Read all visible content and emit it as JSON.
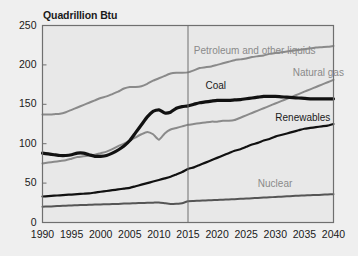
{
  "chart_data": {
    "type": "line",
    "title": "Quadrillion Btu",
    "xlabel": "",
    "ylabel": "Quadrillion Btu",
    "xlim": [
      1990,
      2040
    ],
    "ylim": [
      0,
      250
    ],
    "ytick_labels": [
      "0",
      "50",
      "100",
      "150",
      "200",
      "250"
    ],
    "yticks": [
      0,
      50,
      100,
      150,
      200,
      250
    ],
    "xtick_labels": [
      "1990",
      "1995",
      "2000",
      "2005",
      "2010",
      "2015",
      "2020",
      "2025",
      "2030",
      "2035",
      "2040"
    ],
    "xticks": [
      1990,
      1995,
      2000,
      2005,
      2010,
      2015,
      2020,
      2025,
      2030,
      2035,
      2040
    ],
    "grid": false,
    "legend_position": "inline-annotations",
    "history_projection_divider": 2015,
    "x": [
      1990,
      1991,
      1992,
      1993,
      1994,
      1995,
      1996,
      1997,
      1998,
      1999,
      2000,
      2001,
      2002,
      2003,
      2004,
      2005,
      2006,
      2007,
      2008,
      2009,
      2010,
      2011,
      2012,
      2013,
      2014,
      2015,
      2016,
      2017,
      2018,
      2019,
      2020,
      2021,
      2022,
      2023,
      2024,
      2025,
      2026,
      2027,
      2028,
      2029,
      2030,
      2031,
      2032,
      2033,
      2034,
      2035,
      2036,
      2037,
      2038,
      2039,
      2040
    ],
    "series": [
      {
        "name": "Petroleum and other liquids",
        "color": "#8a8a8a",
        "width": 2.0,
        "label_x": 2016,
        "label_y": 216,
        "values": [
          137,
          137,
          137.5,
          138,
          140,
          143,
          146,
          149,
          152,
          155,
          158,
          160,
          163,
          166,
          170,
          172,
          172,
          173,
          176,
          180,
          183,
          186,
          189,
          190,
          190,
          190.5,
          193,
          196,
          197,
          198,
          200,
          202,
          204,
          206,
          207,
          208,
          210,
          211,
          212,
          214,
          215,
          216,
          217,
          218,
          219,
          220,
          221,
          222,
          222.5,
          223,
          224
        ]
      },
      {
        "name": "Coal",
        "color": "#111111",
        "width": 3.2,
        "label_x": 2018,
        "label_y": 172,
        "values": [
          88,
          87,
          86,
          85,
          85,
          86,
          88,
          88,
          86,
          84,
          84,
          85,
          88,
          92,
          97,
          104,
          114,
          124,
          134,
          141,
          143,
          139,
          140,
          145,
          147,
          148,
          150,
          152,
          153,
          154,
          155,
          155,
          155,
          155.5,
          156,
          157,
          158,
          159,
          160,
          160,
          160,
          159.5,
          159,
          158.5,
          158,
          157.5,
          157,
          157,
          157,
          157,
          157
        ]
      },
      {
        "name": "Natural gas",
        "color": "#8a8a8a",
        "width": 2.0,
        "label_x": 2033,
        "label_y": 188,
        "values": [
          75,
          76,
          77,
          78,
          79,
          81,
          83,
          84,
          85,
          86,
          88,
          90,
          93,
          97,
          100,
          104,
          108,
          112,
          115,
          112,
          105,
          113,
          118,
          120,
          122,
          124,
          125,
          126,
          127,
          128,
          128,
          129,
          129,
          130,
          133,
          136,
          139,
          142,
          145,
          148,
          151,
          154,
          157,
          160,
          163,
          166,
          169,
          172,
          175,
          178,
          181
        ]
      },
      {
        "name": "Renewables",
        "color": "#111111",
        "width": 2.2,
        "label_x": 2030,
        "label_y": 131,
        "values": [
          33,
          33.5,
          34,
          34.5,
          35,
          35.5,
          36,
          36.5,
          37,
          38,
          39,
          40,
          41,
          42,
          43,
          44,
          46,
          48,
          50,
          52,
          54,
          56,
          58,
          61,
          64,
          68,
          70,
          73,
          76,
          79,
          82,
          85,
          88,
          91,
          93,
          96,
          99,
          101,
          104,
          106,
          109,
          111,
          113,
          115,
          117,
          119,
          120,
          121,
          122,
          123,
          125
        ]
      },
      {
        "name": "Nuclear",
        "color": "#555555",
        "width": 2.0,
        "label_x": 2027,
        "label_y": 48,
        "values": [
          20,
          20.3,
          20.6,
          21,
          21.3,
          21.6,
          22,
          22.2,
          22.5,
          22.8,
          23,
          23.2,
          23.4,
          23.6,
          24,
          24.2,
          24.5,
          24.8,
          25,
          25.2,
          25.5,
          24.5,
          23.5,
          23.8,
          24.5,
          27,
          27.3,
          27.6,
          28,
          28.3,
          28.6,
          29,
          29.3,
          29.6,
          30,
          30.4,
          30.8,
          31.2,
          31.6,
          32,
          32.4,
          32.8,
          33.2,
          33.6,
          34,
          34.3,
          34.6,
          34.9,
          35.2,
          35.6,
          36
        ]
      }
    ]
  },
  "colors": {
    "page_background": "#efefef",
    "plot_background": "#e8e8e8",
    "frame": "#6f6f6f",
    "text": "#1a1a1a",
    "gray_series": "#8a8a8a",
    "dark_series": "#111111",
    "divider": "#6f6f6f"
  }
}
